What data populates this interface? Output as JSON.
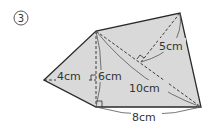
{
  "problem_number": "③",
  "colors": {
    "fill": "#d9d9d9",
    "stroke": "#2a2a2a",
    "background": "#ffffff"
  },
  "figure": {
    "type": "quadrilateral-pentagon-composite",
    "vertices": {
      "left": [
        44,
        80
      ],
      "top_left": [
        96,
        31
      ],
      "top_right": [
        180,
        13
      ],
      "bottom_right": [
        201,
        107
      ],
      "bottom_left": [
        96,
        107
      ]
    },
    "labels": {
      "left_height": "4cm",
      "vertical": "6cm",
      "perpendicular": "5cm",
      "diagonal": "10cm",
      "base": "8cm"
    }
  }
}
